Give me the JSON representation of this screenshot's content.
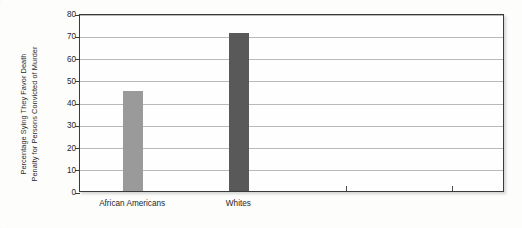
{
  "chart_data": {
    "type": "bar",
    "title": "",
    "subtitle": "",
    "xlabel": "",
    "ylabel_lines": [
      "Percentage Sying They Favor Death",
      "Penalty for Persons Convicted of Murder"
    ],
    "ylabel": "Percentage Sying They Favor Death Penalty for Persons Convicted of Murder",
    "categories": [
      "African Americans",
      "Whites"
    ],
    "values": [
      45,
      71
    ],
    "yticks": [
      0,
      10,
      20,
      30,
      40,
      50,
      60,
      70,
      80
    ],
    "ytick_labels": [
      "0",
      "10",
      "20",
      "30",
      "40",
      "50",
      "60",
      "70",
      "80"
    ],
    "ylim": [
      0,
      80
    ],
    "grid": true,
    "legend": "none",
    "bar_colors": [
      "#9a9a9a",
      "#595959"
    ],
    "x_tick_positions": [
      0.125,
      0.375,
      0.625,
      0.875
    ],
    "frame_color": "#3a3a3a",
    "gridline_color": "#b9b9b9",
    "plot_background": "#fefefe",
    "page_background": "#fdfdfc"
  }
}
